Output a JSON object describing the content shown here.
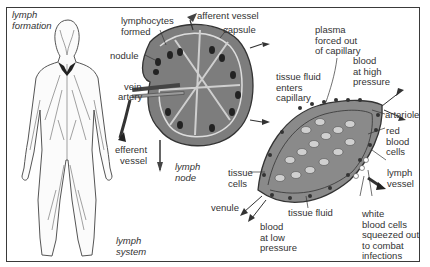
{
  "diagram": {
    "panels": {
      "body": {
        "heading": "lymph\nformation",
        "caption": "lymph\nsystem"
      },
      "lymph_node": {
        "caption": "lymph\nnode",
        "labels": {
          "lymphocytes": "lymphocytes\nformed",
          "afferent": "afferent vessel",
          "capsule": "capsule",
          "nodule": "nodule",
          "vein": "vein",
          "artery": "artery",
          "efferent": "efferent\nvessel"
        }
      },
      "capillary_bed": {
        "labels": {
          "plasma": "plasma\nforced out\nof capillary",
          "tissue_fluid_enters": "tissue fluid\nenters\ncapillary",
          "blood_high": "blood\nat high\npressure",
          "arteriole": "arteriole",
          "red_cells": "red\nblood\ncells",
          "lymph_vessel": "lymph\nvessel",
          "tissue_cells": "tissue\ncells",
          "venule": "venule",
          "tissue_fluid": "tissue fluid",
          "blood_low": "blood\nat low\npressure",
          "white_cells": "white\nblood cells\nsqueezed out\nto combat\ninfections"
        }
      }
    },
    "colors": {
      "ink": "#2a2a2a",
      "fill_dark": "#555555",
      "fill_mid": "#8a8a8a",
      "fill_light": "#c9c9c9",
      "background": "#ffffff"
    }
  }
}
